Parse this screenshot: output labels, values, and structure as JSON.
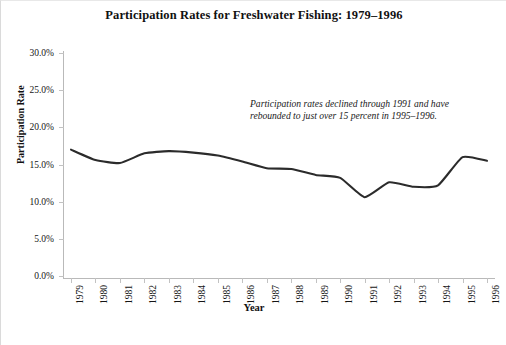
{
  "chart_data": {
    "type": "line",
    "title": "Participation Rates for Freshwater Fishing: 1979–1996",
    "xlabel": "Year",
    "ylabel": "Participation Rate",
    "categories": [
      "1979",
      "1980",
      "1981",
      "1982",
      "1983",
      "1984",
      "1985",
      "1986",
      "1987",
      "1988",
      "1989",
      "1990",
      "1991",
      "1992",
      "1993",
      "1994",
      "1995",
      "1996"
    ],
    "values": [
      17.0,
      15.6,
      15.2,
      16.5,
      16.8,
      16.6,
      16.2,
      15.4,
      14.5,
      14.4,
      13.6,
      13.2,
      10.6,
      12.6,
      12.0,
      12.2,
      16.0,
      15.5
    ],
    "ylim": [
      0,
      30
    ],
    "yticks": [
      0,
      5,
      10,
      15,
      20,
      25,
      30
    ],
    "ytick_labels": [
      "0.0%",
      "5.0%",
      "10.0%",
      "15.0%",
      "20.0%",
      "25.0%",
      "30.0%"
    ],
    "grid": false,
    "legend": "none",
    "line_color": "#2b2b2b",
    "annotation": "Participation rates declined through 1991 and have rebounded to just over 15 percent in 1995–1996."
  },
  "footer": {
    "note": ""
  }
}
